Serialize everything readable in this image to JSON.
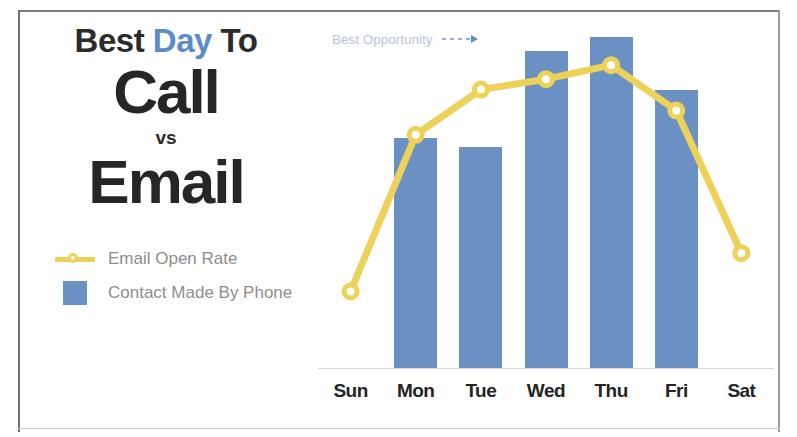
{
  "title": {
    "line1_prefix": "Best ",
    "line1_accent": "Day",
    "line1_suffix": " To",
    "line2": "Call",
    "separator": "vs",
    "line3": "Email"
  },
  "legend": {
    "items": [
      {
        "label": "Email Open Rate",
        "marker": "line-with-marker-icon",
        "color": "#edd158"
      },
      {
        "label": "Contact Made By Phone",
        "marker": "square-swatch-icon",
        "color": "#6b90c3"
      }
    ]
  },
  "annotation": {
    "text": "Best Opportunity",
    "arrow": "dashed-arrow-right-icon",
    "color": "#b6c6dd"
  },
  "colors": {
    "bar": "#6b90c3",
    "line": "#edd158",
    "accent": "#5b8cc8",
    "text_dark": "#262626",
    "text_muted": "#8e8e8e",
    "baseline": "#cfd8e4"
  },
  "chart_data": {
    "type": "bar",
    "title": "Best Day To Call vs Email",
    "xlabel": "",
    "ylabel": "",
    "grid": false,
    "legend_position": "left-panel",
    "ylim": [
      0,
      100
    ],
    "categories": [
      "Sun",
      "Mon",
      "Tue",
      "Wed",
      "Thu",
      "Fri",
      "Sat"
    ],
    "series": [
      {
        "name": "Contact Made By Phone",
        "type": "bar",
        "color": "#6b90c3",
        "values": [
          0,
          66,
          63.5,
          91,
          95,
          80,
          0
        ]
      },
      {
        "name": "Email Open Rate",
        "type": "line",
        "color": "#edd158",
        "values": [
          22,
          67,
          80,
          83,
          87,
          74,
          33
        ]
      }
    ],
    "annotations": [
      {
        "text": "Best Opportunity",
        "points_to": "Thu",
        "style": "dashed-arrow"
      }
    ]
  }
}
